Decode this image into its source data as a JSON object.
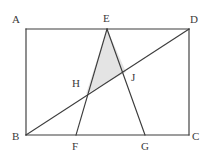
{
  "figure": {
    "name": "rectangle-with-inscribed-triangle-and-diagonal",
    "canvas": {
      "width": 211,
      "height": 157
    },
    "colors": {
      "background": "#ffffff",
      "stroke": "#3c3c3c",
      "shaded_fill": "#e4e4e4",
      "label_text": "#3a3a3a"
    },
    "stroke_width": 1.15
  },
  "points": {
    "A": {
      "label": "A",
      "x": 26,
      "y": 29,
      "label_x": 12,
      "label_y": 14
    },
    "B": {
      "label": "B",
      "x": 26,
      "y": 135,
      "label_x": 12,
      "label_y": 131
    },
    "C": {
      "label": "C",
      "x": 189,
      "y": 135,
      "label_x": 192,
      "label_y": 131
    },
    "D": {
      "label": "D",
      "x": 189,
      "y": 29,
      "label_x": 190,
      "label_y": 14
    },
    "E": {
      "label": "E",
      "x": 107,
      "y": 29,
      "label_x": 103,
      "label_y": 13
    },
    "F": {
      "label": "F",
      "x": 76,
      "y": 135,
      "label_x": 72,
      "label_y": 141
    },
    "G": {
      "label": "G",
      "x": 145,
      "y": 135,
      "label_x": 141,
      "label_y": 141
    },
    "H": {
      "label": "H",
      "x": 86,
      "y": 94,
      "label_x": 72,
      "label_y": 78
    },
    "J": {
      "label": "J",
      "x": 126,
      "y": 72,
      "label_x": 131,
      "label_y": 72
    }
  },
  "segments": [
    {
      "name": "rectangle-side-AD",
      "from": "A",
      "to": "D"
    },
    {
      "name": "rectangle-side-DC",
      "from": "D",
      "to": "C"
    },
    {
      "name": "rectangle-side-CB",
      "from": "C",
      "to": "B"
    },
    {
      "name": "rectangle-side-BA",
      "from": "B",
      "to": "A"
    },
    {
      "name": "segment-EF",
      "from": "E",
      "to": "F"
    },
    {
      "name": "segment-EG",
      "from": "E",
      "to": "G"
    },
    {
      "name": "diagonal-BD",
      "from": "B",
      "to": "D"
    }
  ],
  "shaded_region": {
    "name": "shaded-triangle-EHJ",
    "vertices": [
      "E",
      "H",
      "J"
    ],
    "fill": "#e4e4e4"
  }
}
